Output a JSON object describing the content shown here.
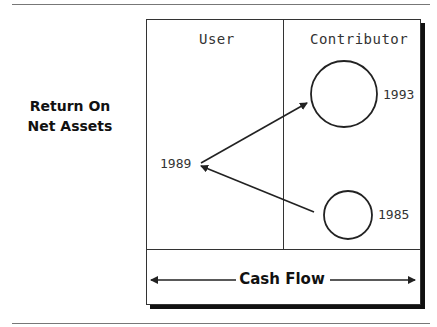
{
  "diagram": {
    "y_axis_label": [
      "Return On",
      "Net Assets"
    ],
    "columns": [
      {
        "label": "User"
      },
      {
        "label": "Contributor"
      }
    ],
    "x_axis_label": "Cash Flow",
    "nodes": [
      {
        "id": "1993",
        "label": "1993",
        "column": "Contributor",
        "shape": "circle",
        "size": "large"
      },
      {
        "id": "1985",
        "label": "1985",
        "column": "Contributor",
        "shape": "circle",
        "size": "small"
      },
      {
        "id": "1989",
        "label": "1989",
        "column": "User",
        "shape": "point"
      }
    ],
    "edges": [
      {
        "from": "1985",
        "to": "1989"
      },
      {
        "from": "1989",
        "to": "1993"
      }
    ],
    "colors": {
      "line": "#222222",
      "shadow": "#111111",
      "background": "#ffffff"
    }
  }
}
